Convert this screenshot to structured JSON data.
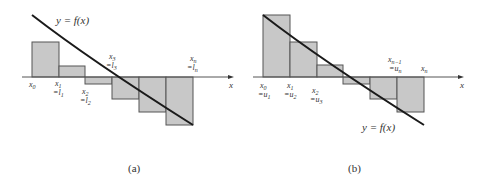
{
  "panels": [
    {
      "id": "a",
      "caption": "(a)",
      "curve_label": "y = f(x)",
      "axis_label": "x",
      "x_labels": [
        {
          "top": "x0",
          "bottom": ""
        },
        {
          "top": "x1",
          "bottom": "=l1"
        },
        {
          "top": "x2",
          "bottom": "=l2"
        },
        {
          "top": "x3",
          "bottom": "=l3"
        },
        {
          "top": "xn",
          "bottom": "=ln"
        }
      ],
      "description": "Lower Riemann sum rectangles for decreasing function crossing x-axis"
    },
    {
      "id": "b",
      "caption": "(b)",
      "curve_label": "y = f(x)",
      "axis_label": "x",
      "x_labels": [
        {
          "top": "x0",
          "bottom": "=u1"
        },
        {
          "top": "x1",
          "bottom": "=u2"
        },
        {
          "top": "x2",
          "bottom": "=u3"
        },
        {
          "top": "xn−1",
          "bottom": "=un"
        },
        {
          "top": "xn",
          "bottom": ""
        }
      ],
      "description": "Upper Riemann sum rectangles for decreasing function crossing x-axis"
    }
  ],
  "colors": {
    "bar_fill": "#c8c8c8",
    "bar_stroke": "#555555",
    "curve": "#1a1a1a",
    "axis": "#555555"
  }
}
